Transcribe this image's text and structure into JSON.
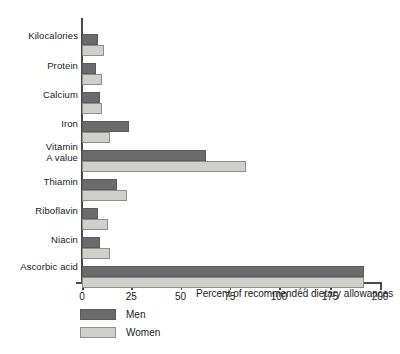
{
  "chart_data": {
    "type": "bar",
    "orientation": "horizontal",
    "title": "",
    "xlabel": "Percent of recommended dietary allowances",
    "ylabel": "",
    "categories": [
      "Kilocalories",
      "Protein",
      "Calcium",
      "Iron",
      "Vitamin\nA value",
      "Thiamin",
      "Riboflavin",
      "Niacin",
      "Ascorbic acid"
    ],
    "series": [
      {
        "name": "Men",
        "color": "#6b6b6b",
        "values": [
          8,
          7,
          9,
          24,
          63,
          18,
          8,
          9,
          192
        ]
      },
      {
        "name": "Women",
        "color": "#cfcfcc",
        "values": [
          11,
          10,
          10,
          14,
          83,
          23,
          13,
          14,
          192
        ]
      }
    ],
    "xticks": [
      0,
      25,
      50,
      75,
      100,
      175,
      200
    ],
    "xtick_labels": [
      "0",
      "25",
      "50",
      "75",
      "100",
      "175",
      "200"
    ],
    "xlim": [
      0,
      200
    ],
    "axis_break": {
      "present": true,
      "between": [
        100,
        175
      ],
      "symbol": "//"
    },
    "grid": false,
    "legend_position": "below-left",
    "legend": [
      "Men",
      "Women"
    ]
  },
  "axis": {
    "title": "Percent of recommended dietary allowances"
  },
  "legend": {
    "men_label": "Men",
    "women_label": "Women"
  },
  "caption": {
    "clipped_text": ""
  }
}
